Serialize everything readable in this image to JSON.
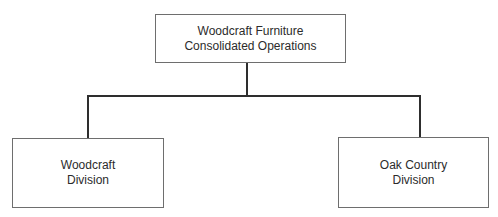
{
  "diagram": {
    "type": "org-chart",
    "root": {
      "lines": [
        "Woodcraft Furniture",
        "Consolidated Operations"
      ]
    },
    "children": [
      {
        "lines": [
          "Woodcraft",
          "Division"
        ]
      },
      {
        "lines": [
          "Oak Country",
          "Division"
        ]
      }
    ],
    "colors": {
      "box_border": "#6e6e6e",
      "connector": "#2e2e2e",
      "text": "#2b2b2b",
      "background": "#ffffff"
    }
  }
}
